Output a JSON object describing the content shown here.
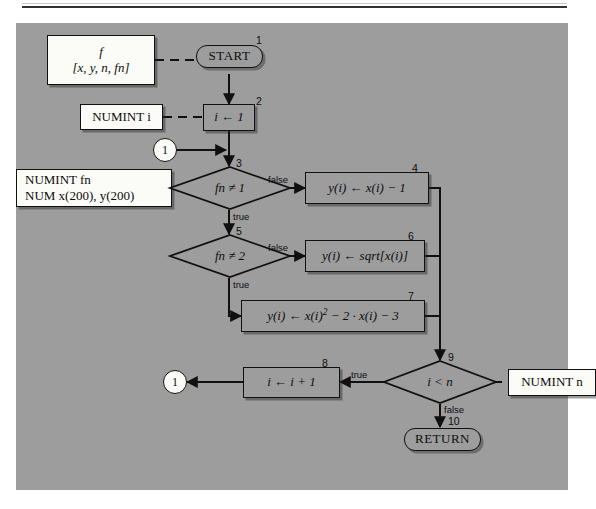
{
  "figure": {
    "panel_color": "#9d9d9d",
    "ink_color": "#101010",
    "io_box_color": "#fbfbf7"
  },
  "nodes": [
    {
      "id": "params-box",
      "kind": "io-box",
      "name": "parameter-declaration-box",
      "line1": "f",
      "line2": "[x, y, n, fn]"
    },
    {
      "id": "start",
      "kind": "terminal",
      "name": "start-terminal",
      "label": "START",
      "step": "1"
    },
    {
      "id": "numint-i",
      "kind": "io-box",
      "name": "numint-i-declaration-box",
      "label": "NUMINT i"
    },
    {
      "id": "init-i",
      "kind": "process",
      "name": "initialize-i-process",
      "label": "i ← 1",
      "step": "2"
    },
    {
      "id": "connector-in",
      "kind": "connector",
      "name": "connector-circle-1-entry",
      "label": "1"
    },
    {
      "id": "numint-fn",
      "kind": "io-box",
      "name": "numint-fn-declaration-box",
      "line1": "NUMINT fn",
      "line2": "NUM x(200), y(200)"
    },
    {
      "id": "decision-fn1",
      "kind": "decision",
      "name": "decision-fn-not-equal-1",
      "label": "fn ≠ 1",
      "step": "3",
      "false_label": "false",
      "true_label": "true"
    },
    {
      "id": "calc-linear",
      "kind": "process",
      "name": "compute-linear-process",
      "label": "y(i) ← x(i) − 1",
      "step": "4"
    },
    {
      "id": "decision-fn2",
      "kind": "decision",
      "name": "decision-fn-not-equal-2",
      "label": "fn ≠ 2",
      "step": "5",
      "false_label": "false",
      "true_label": "true"
    },
    {
      "id": "calc-sqrt",
      "kind": "process",
      "name": "compute-sqrt-process",
      "label": "y(i) ← sqrt[x(i)]",
      "step": "6"
    },
    {
      "id": "calc-quadratic",
      "kind": "process",
      "name": "compute-quadratic-process",
      "label": "y(i) ← x(i)² − 2 · x(i) − 3",
      "step": "7"
    },
    {
      "id": "decision-loop",
      "kind": "decision",
      "name": "decision-i-less-than-n",
      "label": "i < n",
      "step": "9",
      "true_label": "true",
      "false_label": "false"
    },
    {
      "id": "numint-n",
      "kind": "io-box",
      "name": "numint-n-declaration-box",
      "label": "NUMINT n"
    },
    {
      "id": "increment-i",
      "kind": "process",
      "name": "increment-i-process",
      "label": "i ← i + 1",
      "step": "8"
    },
    {
      "id": "connector-out",
      "kind": "connector",
      "name": "connector-circle-1-exit",
      "label": "1"
    },
    {
      "id": "return",
      "kind": "terminal",
      "name": "return-terminal",
      "label": "RETURN",
      "step": "10"
    }
  ],
  "steps": {
    "n1": "1",
    "n2": "2",
    "n3": "3",
    "n4": "4",
    "n5": "5",
    "n6": "6",
    "n7": "7",
    "n8": "8",
    "n9": "9",
    "n10": "10"
  },
  "edge_labels": {
    "fn1_false": "false",
    "fn1_true": "true",
    "fn2_false": "false",
    "fn2_true": "true",
    "loop_true": "true",
    "loop_false": "false"
  },
  "text": {
    "params_line1": "f",
    "params_line2": "[x, y, n, fn]",
    "start": "START",
    "numint_i": "NUMINT i",
    "init_i": "i ← 1",
    "connector_in": "1",
    "numint_fn_line1": "NUMINT fn",
    "numint_fn_line2": "NUM x(200), y(200)",
    "decision_fn1": "fn ≠ 1",
    "calc_linear": "y(i) ← x(i) − 1",
    "decision_fn2": "fn ≠ 2",
    "calc_sqrt": "y(i) ← sqrt[x(i)]",
    "calc_quadratic_pre": "y(i) ← x(i)",
    "calc_quadratic_sup": "2",
    "calc_quadratic_post": " − 2 · x(i) − 3",
    "decision_loop": "i < n",
    "numint_n": "NUMINT n",
    "increment_i": "i ← i + 1",
    "connector_out": "1",
    "return": "RETURN"
  }
}
